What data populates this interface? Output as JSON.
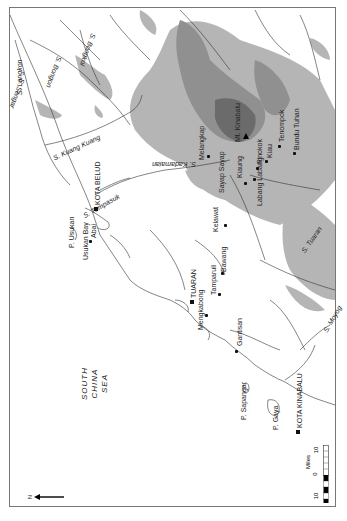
{
  "map": {
    "orientation": "rotated 90 degrees (north points left)",
    "north_arrow": {
      "label": "N",
      "direction": "left"
    },
    "scale_bar": {
      "unit_label": "Miles",
      "ticks": [
        "10",
        "0",
        "10"
      ]
    },
    "sea_label": [
      "SOUTH",
      "CHINA",
      "SEA"
    ],
    "towns": [
      {
        "name": "KOTA BELUD",
        "type": "major"
      },
      {
        "name": "TUARAN",
        "type": "major"
      },
      {
        "name": "KOTA KINABALU",
        "type": "major"
      },
      {
        "name": "Abai",
        "type": "village"
      },
      {
        "name": "Kelawat",
        "type": "village"
      },
      {
        "name": "Tamparuli",
        "type": "village"
      },
      {
        "name": "Bawang",
        "type": "village"
      },
      {
        "name": "Mengkabong",
        "type": "village"
      },
      {
        "name": "Gantisan",
        "type": "village"
      },
      {
        "name": "Melangkap",
        "type": "village"
      },
      {
        "name": "Sayap Sayap",
        "type": "village"
      },
      {
        "name": "Kiaung",
        "type": "village"
      },
      {
        "name": "Pinokok",
        "type": "village"
      },
      {
        "name": "Kiau",
        "type": "village"
      },
      {
        "name": "Tenompok",
        "type": "village"
      },
      {
        "name": "Bundu Tuhan",
        "type": "village"
      },
      {
        "name": "Labang Labang",
        "type": "village"
      }
    ],
    "peak": {
      "name": "Mt. Kinabalu"
    },
    "islands": [
      "P. Usukan",
      "P. Sapangar",
      "P. Gaya"
    ],
    "bays": [
      "Usukan Bay"
    ],
    "rivers": [
      "S. Bongkol",
      "S. Bongon",
      "S. Langkon",
      "S. Sengar",
      "S. Kuang Kuang",
      "S. Tempasuk",
      "S. Kadamaian",
      "S. Tuaran",
      "S. Moyog"
    ],
    "colors": {
      "background": "#ffffff",
      "relief_low": "#b3b3b3",
      "relief_mid": "#8f8f8f",
      "relief_high": "#666666",
      "lines": "#333333",
      "frame": "#777777"
    }
  }
}
